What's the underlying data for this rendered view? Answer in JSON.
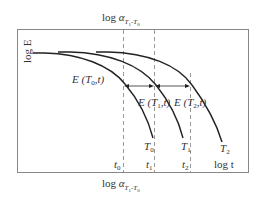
{
  "diagram": {
    "title_top": {
      "prefix": "log ",
      "alpha": "α",
      "sub": "T",
      "sub1": "1",
      "dash": "-",
      "sub2": "T",
      "sub3": "0"
    },
    "title_bottom": {
      "prefix": "log ",
      "alpha": "α",
      "sub": "T",
      "sub1": "1",
      "dash": "-",
      "sub2": "T",
      "sub3": "0"
    },
    "y_axis_label": "log E",
    "x_axis_label": "log t",
    "curves": [
      {
        "name": "T0",
        "label": "T",
        "sub": "0",
        "annotation": "E (T",
        "annotation_sub": "0",
        "annotation_tail": ",t)"
      },
      {
        "name": "T1",
        "label": "T",
        "sub": "1",
        "annotation": "E (T",
        "annotation_sub": "1",
        "annotation_tail": ",t)"
      },
      {
        "name": "T2",
        "label": "T",
        "sub": "2",
        "annotation": "E (T",
        "annotation_sub": "2",
        "annotation_tail": ",t)"
      }
    ],
    "time_ticks": [
      {
        "label": "t",
        "sub": "0"
      },
      {
        "label": "t",
        "sub": "1"
      },
      {
        "label": "t",
        "sub": "2"
      }
    ],
    "colors": {
      "line": "#222222",
      "frame": "#888888",
      "dash": "#999999",
      "text": "#333333"
    }
  }
}
